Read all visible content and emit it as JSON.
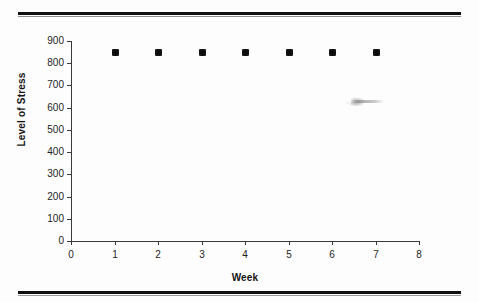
{
  "page": {
    "background_color": "#fdfdfd",
    "rule_color": "#101010"
  },
  "chart_data": {
    "type": "scatter",
    "title": "",
    "xlabel": "Week",
    "ylabel": "Level of Stress",
    "x": [
      1,
      2,
      3,
      4,
      5,
      6,
      7
    ],
    "values": [
      850,
      850,
      850,
      850,
      850,
      850,
      850
    ],
    "series": [
      {
        "name": "Level of Stress",
        "values": [
          850,
          850,
          850,
          850,
          850,
          850,
          850
        ]
      }
    ],
    "xlim": [
      0,
      8
    ],
    "ylim": [
      0,
      900
    ],
    "x_ticks": [
      "0",
      "1",
      "2",
      "3",
      "4",
      "5",
      "6",
      "7",
      "8"
    ],
    "y_ticks": [
      "0",
      "100",
      "200",
      "300",
      "400",
      "500",
      "600",
      "700",
      "800",
      "900"
    ],
    "x_tick_values": [
      0,
      1,
      2,
      3,
      4,
      5,
      6,
      7,
      8
    ],
    "y_tick_values": [
      0,
      100,
      200,
      300,
      400,
      500,
      600,
      700,
      800,
      900
    ],
    "grid": false,
    "legend": false,
    "legend_position": "none",
    "marker": "diamond",
    "marker_color": "#0d0d0d",
    "axis_color": "#3a3a3a"
  },
  "artifacts": {
    "smudge_label": "scan-smudge"
  }
}
